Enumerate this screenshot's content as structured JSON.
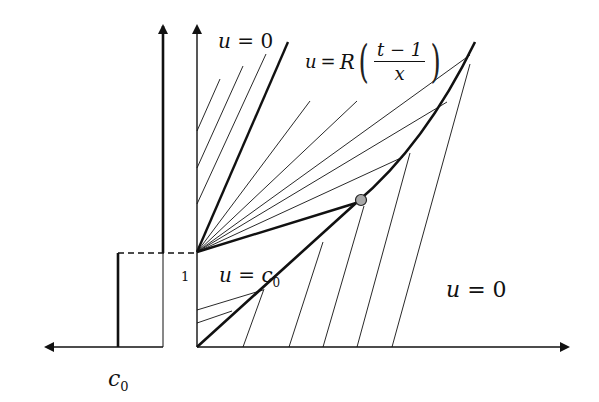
{
  "figure": {
    "type": "characteristics-diagram",
    "colors": {
      "line": "#111111",
      "marker_fill": "#a8a8a8",
      "background": "#ffffff"
    }
  },
  "labels": {
    "u_zero_top": {
      "var": "u",
      "eq": "=",
      "val": "0"
    },
    "u_fan": {
      "var": "u",
      "eq": "=",
      "func": "R",
      "numerator": "t − 1",
      "denominator": "x"
    },
    "u_c0": {
      "var": "u",
      "eq": "=",
      "val": "c",
      "sub": "0"
    },
    "u_zero_right": {
      "var": "u",
      "eq": "=",
      "val": "0"
    },
    "tick_one": "1",
    "c0_axis": {
      "val": "c",
      "sub": "0"
    }
  },
  "geometry": {
    "t_axis_x": 197,
    "x_axis_y": 347,
    "fan_origin": [
      197,
      252
    ],
    "shock_marker": [
      361,
      200
    ],
    "shock_top": [
      475,
      42
    ]
  }
}
